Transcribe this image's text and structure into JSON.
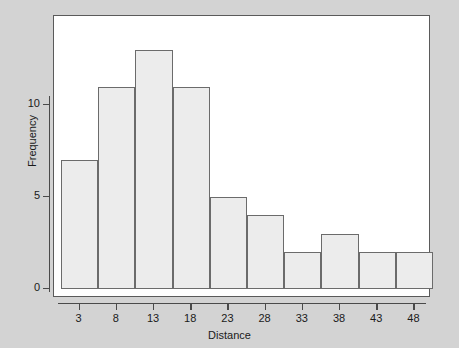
{
  "chart_data": {
    "type": "bar",
    "title": "",
    "subtitle": "",
    "xlabel": "Distance",
    "ylabel": "Frequency",
    "categories": [
      "3",
      "8",
      "13",
      "18",
      "23",
      "28",
      "33",
      "38",
      "43",
      "48"
    ],
    "values": [
      7,
      11,
      13,
      11,
      5,
      4,
      2,
      3,
      2,
      2
    ],
    "bin_width": 5,
    "xtick_labels": [
      "3",
      "8",
      "13",
      "18",
      "23",
      "28",
      "33",
      "38",
      "43",
      "48"
    ],
    "ytick_labels": [
      "0",
      "5",
      "10"
    ],
    "ytick_values": [
      0,
      5,
      10
    ],
    "ylim": [
      0,
      15.3
    ],
    "xlim": [
      0.5,
      50.5
    ],
    "grid": false,
    "legend": null,
    "annotations": [],
    "colors": {
      "background": "#d3d3d3",
      "plot_background": "#ffffff",
      "bar_fill": "#ececec",
      "bar_stroke": "#6b6b6b",
      "frame": "#5a5a5a",
      "axis": "#4a4a4a",
      "text": "#1a1a1a"
    }
  }
}
